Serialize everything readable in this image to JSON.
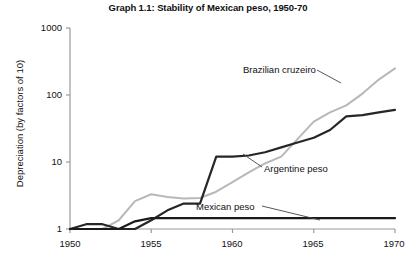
{
  "chart_data": {
    "type": "line",
    "title": "Graph 1.1: Stability of Mexican peso, 1950-70",
    "xlabel": "",
    "ylabel": "Depreciation (by factors of 10)",
    "yscale": "log",
    "ylim": [
      1,
      1000
    ],
    "xlim": [
      1950,
      1970
    ],
    "grid": false,
    "legend_position": "inline-annotations",
    "ytick_labels": [
      "1000",
      "100",
      "10",
      "1"
    ],
    "ytick_values": [
      1000,
      100,
      10,
      1
    ],
    "xtick_labels": [
      "1950",
      "1955",
      "1960",
      "1965",
      "1970"
    ],
    "xtick_values": [
      1950,
      1955,
      1960,
      1965,
      1970
    ],
    "series": [
      {
        "name": "Brazilian cruzeiro",
        "color": "#b8b8b8",
        "width": 2.0,
        "x": [
          1950,
          1951,
          1952,
          1953,
          1954,
          1955,
          1956,
          1957,
          1958,
          1959,
          1960,
          1961,
          1962,
          1963,
          1964,
          1965,
          1966,
          1967,
          1968,
          1969,
          1970
        ],
        "y": [
          1.0,
          1.0,
          1.0,
          1.35,
          2.6,
          3.3,
          3.0,
          2.85,
          2.9,
          3.6,
          5.0,
          7.0,
          9.5,
          12.0,
          22.0,
          40.0,
          55.0,
          70.0,
          105.0,
          170.0,
          250.0
        ]
      },
      {
        "name": "Argentine peso",
        "color": "#262626",
        "width": 2.2,
        "x": [
          1950,
          1951,
          1952,
          1953,
          1954,
          1955,
          1956,
          1957,
          1958,
          1959,
          1960,
          1961,
          1962,
          1963,
          1964,
          1965,
          1966,
          1967,
          1968,
          1969,
          1970
        ],
        "y": [
          1.0,
          1.18,
          1.18,
          1.0,
          1.0,
          1.35,
          1.9,
          2.4,
          2.4,
          12.0,
          12.0,
          12.5,
          14.0,
          16.5,
          19.5,
          23.0,
          30.0,
          48.0,
          50.0,
          55.0,
          60.0
        ]
      },
      {
        "name": "Mexican peso",
        "color": "#1a1a1a",
        "width": 2.2,
        "x": [
          1950,
          1951,
          1952,
          1953,
          1954,
          1955,
          1956,
          1957,
          1958,
          1959,
          1960,
          1961,
          1962,
          1963,
          1964,
          1965,
          1966,
          1967,
          1968,
          1969,
          1970
        ],
        "y": [
          1.0,
          1.0,
          1.0,
          1.0,
          1.3,
          1.45,
          1.45,
          1.45,
          1.45,
          1.45,
          1.45,
          1.45,
          1.45,
          1.45,
          1.45,
          1.45,
          1.45,
          1.45,
          1.45,
          1.45,
          1.45
        ]
      }
    ],
    "annotations": [
      {
        "text": "Brazilian cruzeiro",
        "label_x": 243,
        "label_y": 64,
        "leader": [
          [
            317,
            70
          ],
          [
            341,
            83
          ]
        ]
      },
      {
        "text": "Argentine peso",
        "label_x": 264,
        "label_y": 163,
        "leader": [
          [
            243,
            154
          ],
          [
            262,
            167
          ]
        ]
      },
      {
        "text": "Mexican peso",
        "label_x": 196,
        "label_y": 201,
        "leader": [
          [
            262,
            206
          ],
          [
            320,
            220
          ]
        ]
      }
    ],
    "axis_color": "#9a9a9a"
  }
}
